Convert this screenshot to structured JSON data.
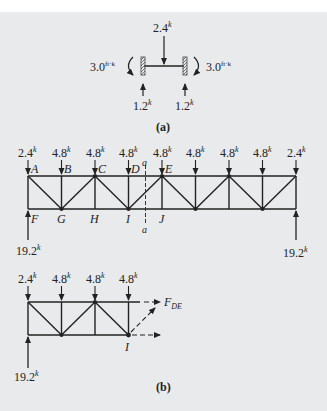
{
  "colors": {
    "background": "#e8eaec",
    "ink": "#222222",
    "accent_label": "#3a3a8a"
  },
  "part_a": {
    "caption": "(a)",
    "load_top": {
      "value": "2.4",
      "unit": "k"
    },
    "moment_left": {
      "value": "3.0",
      "unit": "ft·k"
    },
    "moment_right": {
      "value": "3.0",
      "unit": "ft·k"
    },
    "reaction_left": {
      "value": "1.2",
      "unit": "k"
    },
    "reaction_right": {
      "value": "1.2",
      "unit": "k"
    }
  },
  "part_b_full": {
    "top_loads": [
      {
        "value": "2.4",
        "unit": "k"
      },
      {
        "value": "4.8",
        "unit": "k"
      },
      {
        "value": "4.8",
        "unit": "k"
      },
      {
        "value": "4.8",
        "unit": "k"
      },
      {
        "value": "4.8",
        "unit": "k"
      },
      {
        "value": "4.8",
        "unit": "k"
      },
      {
        "value": "4.8",
        "unit": "k"
      },
      {
        "value": "4.8",
        "unit": "k"
      },
      {
        "value": "2.4",
        "unit": "k"
      }
    ],
    "top_nodes": [
      "A",
      "B",
      "C",
      "D",
      "E"
    ],
    "bottom_nodes": [
      "F",
      "G",
      "H",
      "I",
      "J"
    ],
    "section_label": "a",
    "reaction_left": {
      "value": "19.2",
      "unit": "k"
    },
    "reaction_right": {
      "value": "19.2",
      "unit": "k"
    }
  },
  "part_b_free_body": {
    "top_loads": [
      {
        "value": "2.4",
        "unit": "k"
      },
      {
        "value": "4.8",
        "unit": "k"
      },
      {
        "value": "4.8",
        "unit": "k"
      },
      {
        "value": "4.8",
        "unit": "k"
      }
    ],
    "force_label": "F",
    "force_subscript": "DE",
    "node_label": "I",
    "reaction_left": {
      "value": "19.2",
      "unit": "k"
    },
    "caption": "(b)"
  }
}
